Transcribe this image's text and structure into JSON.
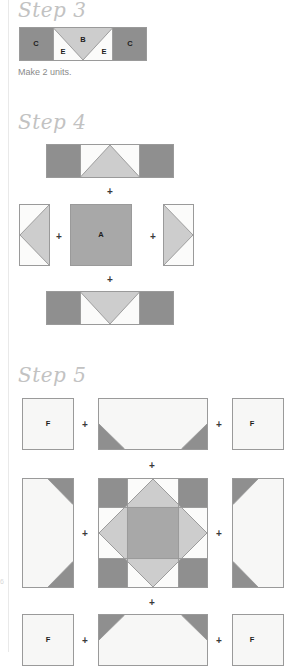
{
  "page": {
    "width": 258,
    "height": 652,
    "background": "#ffffff",
    "gutter_rule_color": "#e9e9e9",
    "edge_mark": "6"
  },
  "palette": {
    "dark_gray": "#8f8f8f",
    "medium_gray": "#a8a8a8",
    "light_gray": "#cdcdcd",
    "pale_gray": "#d6d6d6",
    "white_fabric": "#f7f7f6",
    "outline": "#9a9a9a",
    "label_text": "#1d1d1d",
    "heading_text": "#c2c2c2",
    "caption_text": "#8a8a8a",
    "plus_text": "#3a3a3a"
  },
  "steps": [
    {
      "id": "step-3",
      "heading": "Step 3",
      "caption": "Make 2 units.",
      "rows": [
        {
          "id": "step3-row-1",
          "units": [
            {
              "id": "step3-flying-geese-bar",
              "type": "c-e-b-e-c-bar",
              "labels": [
                "C",
                "E",
                "B",
                "E",
                "C"
              ]
            }
          ]
        }
      ]
    },
    {
      "id": "step-4",
      "heading": "Step 4",
      "caption": "",
      "rows": [
        {
          "id": "step4-row-top",
          "units": [
            {
              "id": "step4-top-bar",
              "type": "bar-triangle-up",
              "labels": []
            }
          ]
        },
        {
          "id": "step4-row-middle",
          "units": [
            {
              "id": "step4-left-rect",
              "type": "rect-triangle-left",
              "labels": []
            },
            {
              "id": "step4-center-square",
              "type": "solid-square",
              "labels": [
                "A"
              ]
            },
            {
              "id": "step4-right-rect",
              "type": "rect-triangle-right",
              "labels": []
            }
          ]
        },
        {
          "id": "step4-row-bottom",
          "units": [
            {
              "id": "step4-bottom-bar",
              "type": "bar-triangle-down",
              "labels": []
            }
          ]
        }
      ],
      "plus_signs": [
        "+",
        "+",
        "+",
        "+"
      ]
    },
    {
      "id": "step-5",
      "heading": "Step 5",
      "caption": "",
      "rows": [
        {
          "id": "step5-row-top",
          "units": [
            {
              "id": "step5-top-left-square",
              "type": "plain-square",
              "labels": [
                "F"
              ]
            },
            {
              "id": "step5-top-bar",
              "type": "wide-bar-corners-bottom",
              "labels": []
            },
            {
              "id": "step5-top-right-square",
              "type": "plain-square",
              "labels": [
                "F"
              ]
            }
          ]
        },
        {
          "id": "step5-row-middle",
          "units": [
            {
              "id": "step5-left-rect",
              "type": "tall-rect-corners-right",
              "labels": []
            },
            {
              "id": "step5-center-block",
              "type": "square-in-square-block",
              "labels": []
            },
            {
              "id": "step5-right-rect",
              "type": "tall-rect-corners-left",
              "labels": []
            }
          ]
        },
        {
          "id": "step5-row-bottom",
          "units": [
            {
              "id": "step5-bottom-left-square",
              "type": "plain-square",
              "labels": [
                "F"
              ]
            },
            {
              "id": "step5-bottom-bar",
              "type": "wide-bar-corners-top",
              "labels": []
            },
            {
              "id": "step5-bottom-right-square",
              "type": "plain-square",
              "labels": [
                "F"
              ]
            }
          ]
        }
      ],
      "plus_signs": [
        "+",
        "+",
        "+",
        "+",
        "+",
        "+",
        "+",
        "+"
      ]
    }
  ],
  "labels": {
    "A": "A",
    "B": "B",
    "C": "C",
    "E": "E",
    "F": "F"
  },
  "plus": "+"
}
